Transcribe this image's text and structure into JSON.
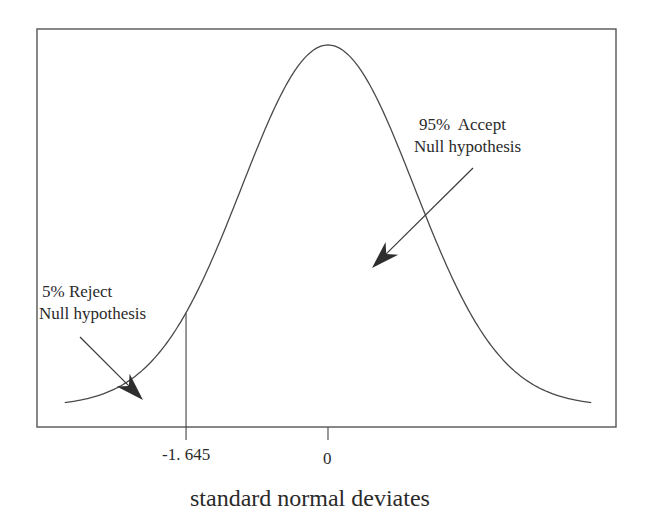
{
  "chart_data": {
    "type": "line",
    "title": "",
    "xlabel": "standard normal deviates",
    "ylabel": "",
    "grid": false,
    "legend": null,
    "distribution": "standard normal",
    "x_range": [
      -3.05,
      3.05
    ],
    "x_ticks": [
      {
        "value": -1.645,
        "label": "-1. 645"
      },
      {
        "value": 0,
        "label": "0"
      }
    ],
    "critical_value": -1.645,
    "annotations": [
      {
        "id": "reject",
        "line1": "5% Reject",
        "line2": "Null hypothesis",
        "percent": 5,
        "region": "z < -1.645"
      },
      {
        "id": "accept",
        "line1": "95%  Accept",
        "line2": "Null hypothesis",
        "percent": 95,
        "region": "z >= -1.645"
      }
    ],
    "series": [
      {
        "name": "standard normal density",
        "x": [
          -3.0,
          -2.5,
          -2.0,
          -1.645,
          -1.5,
          -1.0,
          -0.5,
          0,
          0.5,
          1.0,
          1.5,
          2.0,
          2.5,
          3.0
        ],
        "y": [
          0.0044,
          0.0175,
          0.054,
          0.1031,
          0.1295,
          0.242,
          0.3521,
          0.3989,
          0.3521,
          0.242,
          0.1295,
          0.054,
          0.0175,
          0.0044
        ]
      }
    ]
  },
  "plot": {
    "frame": {
      "left": 37,
      "top": 29,
      "right": 616,
      "bottom": 427
    },
    "center_px": 328,
    "sd_px": 86.3,
    "peak_y_px": 45,
    "base_y_px": 406,
    "z_min": -3.05,
    "z_max": 3.05,
    "tick_bottom_px": 440,
    "colors": {
      "ink": "#2a2a2a",
      "frame": "#555555",
      "curve": "#4a4a4a"
    }
  },
  "labels": {
    "reject_line1": "5% Reject",
    "reject_line2": "Null hypothesis",
    "accept_line1": "95%  Accept",
    "accept_line2": "Null hypothesis",
    "tick_crit": "-1. 645",
    "tick_zero": "0",
    "x_axis_title": "standard normal deviates"
  },
  "arrows": {
    "reject": {
      "x1": 80,
      "y1": 337,
      "x2": 143,
      "y2": 400
    },
    "accept": {
      "x1": 473,
      "y1": 168,
      "x2": 372,
      "y2": 268
    }
  }
}
